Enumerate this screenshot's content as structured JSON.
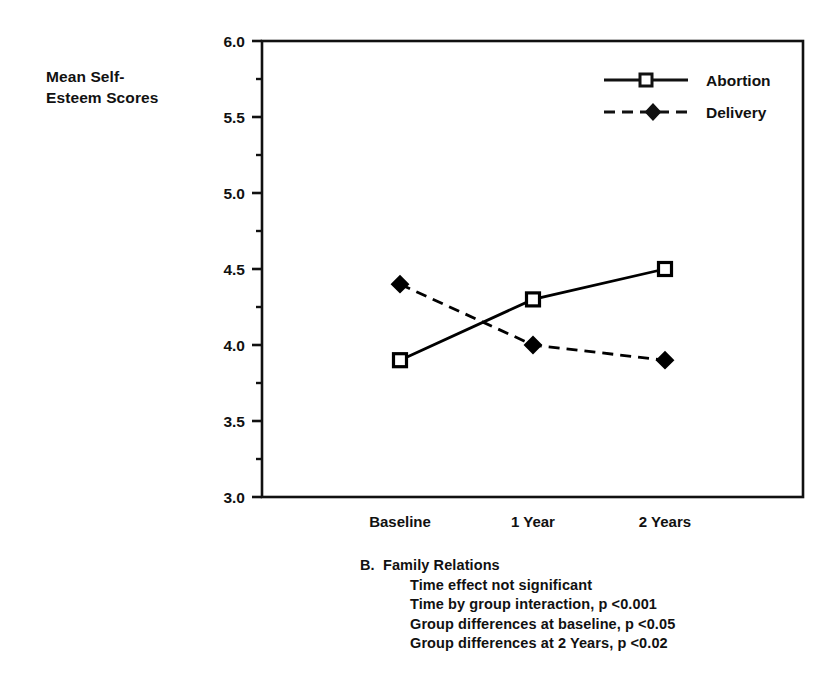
{
  "chart_data": {
    "type": "line",
    "title": "",
    "subtitle": "",
    "xlabel": "",
    "ylabel": "Mean Self-\nEsteem Scores",
    "categories": [
      "Baseline",
      "1 Year",
      "2 Years"
    ],
    "series": [
      {
        "name": "Abortion",
        "values": [
          3.9,
          4.3,
          4.5
        ],
        "line_style": "solid",
        "marker": "open-square",
        "color": "#000000"
      },
      {
        "name": "Delivery",
        "values": [
          4.4,
          4.0,
          3.9
        ],
        "line_style": "dashed",
        "marker": "filled-diamond",
        "color": "#000000"
      }
    ],
    "ylim": [
      3.0,
      6.0
    ],
    "y_major_ticks": [
      3.0,
      3.5,
      4.0,
      4.5,
      5.0,
      5.5,
      6.0
    ],
    "y_tick_labels": [
      "3.0",
      "3.5",
      "4.0",
      "4.5",
      "5.0",
      "5.5",
      "6.0"
    ],
    "y_minor_ticks": [
      3.25,
      3.75,
      4.25,
      4.75,
      5.25,
      5.75
    ],
    "grid": false,
    "legend_position": "top-right",
    "legend_entries": [
      "Abortion",
      "Delivery"
    ]
  },
  "caption": {
    "title": "B.  Family Relations",
    "notes": [
      "Time effect not significant",
      "Time by group interaction, p <0.001",
      "Group differences at baseline, p <0.05",
      "Group differences at 2 Years, p <0.02"
    ]
  }
}
